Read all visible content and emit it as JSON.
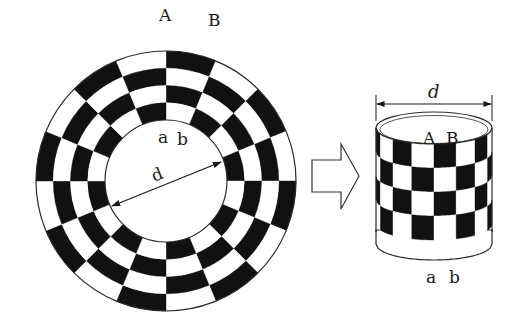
{
  "diagram": {
    "colors": {
      "background": "#ffffff",
      "dark": "#111111",
      "light": "#ffffff",
      "stroke": "#2a2a2a"
    },
    "annulus": {
      "center": [
        166,
        181
      ],
      "outer_radius": 130,
      "inner_radius": 61,
      "rings": 4,
      "sectors": 16,
      "first_dark": "outer ring, sector clockwise from top",
      "labels": {
        "outer_start": "A",
        "outer_end": "B",
        "inner_start": "a",
        "inner_end": "b",
        "diameter": "d"
      },
      "diameter_arrow": {
        "from": [
          112,
          206
        ],
        "to": [
          221,
          162
        ]
      }
    },
    "transform_arrow": {
      "shape": "hollow-right-arrow",
      "points": [
        [
          312,
          160
        ],
        [
          341,
          160
        ],
        [
          341,
          144
        ],
        [
          359,
          176
        ],
        [
          341,
          209
        ],
        [
          341,
          192
        ],
        [
          312,
          192
        ]
      ]
    },
    "cylinder": {
      "left": 376,
      "right": 492,
      "top_ellipse_cy": 128,
      "ellipse_ry": 16,
      "checker_top": 142,
      "rows": 4,
      "row_height": 24,
      "bottom_band_height": 18,
      "visible_columns": 8,
      "labels": {
        "diameter": "d",
        "top_start": "A",
        "top_end": "B",
        "bottom_start": "a",
        "bottom_end": "b"
      },
      "dimension_line_y": 104
    }
  }
}
